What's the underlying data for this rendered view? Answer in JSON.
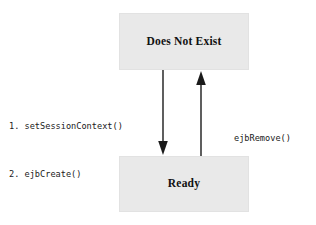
{
  "diagram": {
    "background_color": "#ffffff",
    "box_fill_color": "#e9e9e9",
    "text_color": "#111111",
    "arrow_color": "#1a1a1a",
    "states": [
      {
        "id": "does-not-exist",
        "label": "Does Not Exist",
        "x": 119,
        "y": 13,
        "width": 130,
        "height": 57
      },
      {
        "id": "ready",
        "label": "Ready",
        "x": 119,
        "y": 156,
        "width": 130,
        "height": 56
      }
    ],
    "transitions": [
      {
        "id": "create",
        "from": "does-not-exist",
        "to": "ready",
        "direction": "down",
        "x": 163,
        "label_lines": [
          "1. setSessionContext()",
          "2. ejbCreate()"
        ]
      },
      {
        "id": "remove",
        "from": "ready",
        "to": "does-not-exist",
        "direction": "up",
        "x": 201,
        "label_lines": [
          "ejbRemove()"
        ]
      }
    ]
  }
}
